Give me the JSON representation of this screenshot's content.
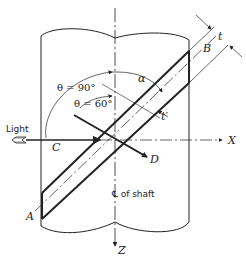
{
  "diagram": {
    "type": "engineering-figure",
    "labels": {
      "light": "Light",
      "point_a": "A",
      "point_b": "B",
      "point_c": "C",
      "point_d": "D",
      "axis_x": "X",
      "axis_z": "Z",
      "thickness_t": "t",
      "thickness_t_prime": "t′",
      "alpha": "α",
      "theta_90": "θ = 90°",
      "theta_60": "θ = 60°",
      "shaft_centerline": "℄ of shaft"
    },
    "colors": {
      "line": "#222222",
      "background": "#ffffff"
    }
  }
}
